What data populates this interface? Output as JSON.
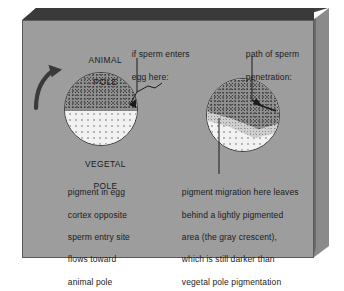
{
  "figure": {
    "panel_color": "#9d9d9d",
    "ink_color": "#1b1b1b"
  },
  "labels": {
    "animal_pole_line1": "ANIMAL",
    "animal_pole_line2": "POLE",
    "vegetal_pole_line1": "VEGETAL",
    "vegetal_pole_line2": "POLE",
    "sperm_entry_line1": "if sperm enters",
    "sperm_entry_line2": "egg here:",
    "penetration_path_line1": "path of sperm",
    "penetration_path_line2": "penetration:"
  },
  "caption_left": {
    "lines": [
      "pigment in egg",
      "cortex opposite",
      "sperm entry site",
      "flows toward",
      "animal pole"
    ]
  },
  "caption_right": {
    "lines": [
      "pigment migration here leaves",
      "behind a lightly pigmented",
      "area (the gray crescent),",
      "which is still darker than",
      "vegetal pole pigmentation"
    ]
  },
  "icons": {
    "rotation_arrow": "curved-rotation-arrow",
    "sperm_entry_arrow": "sperm-entry-arrow",
    "penetration_arrow": "penetration-arrow",
    "crescent_leader": "leader-line"
  }
}
